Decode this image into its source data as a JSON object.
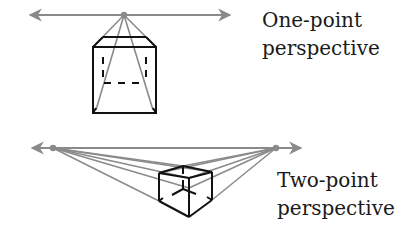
{
  "one_point": {
    "title_line1": "One-point",
    "title_line2": "perspective",
    "horizon": {
      "x1": 28,
      "x2": 232,
      "y": 15
    },
    "vanishing_point": {
      "x": 124,
      "y": 15
    },
    "cube": {
      "front": {
        "x1": 93,
        "y1": 47,
        "x2": 156,
        "y2": 113
      },
      "back_top": {
        "x1": 103,
        "x2": 146,
        "y": 37
      },
      "back_bottom_y": 83
    }
  },
  "two_point": {
    "title_line1": "Two-point",
    "title_line2": "perspective",
    "horizon": {
      "x1": 30,
      "x2": 303,
      "y": 148
    },
    "vanishing_points": [
      {
        "x": 53,
        "y": 148
      },
      {
        "x": 276,
        "y": 148
      }
    ],
    "cube": {
      "top_back": [
        183,
        166
      ],
      "top_left": [
        159,
        173
      ],
      "top_right": [
        212,
        172
      ],
      "top_front": [
        189,
        178
      ],
      "bottom_left": [
        159,
        201
      ],
      "bottom_right": [
        212,
        200
      ],
      "bottom_front": [
        189,
        217
      ]
    }
  },
  "colors": {
    "construction_line": "#8a8a8a",
    "cube_edge": "#111111",
    "text": "#1a1a1a"
  }
}
